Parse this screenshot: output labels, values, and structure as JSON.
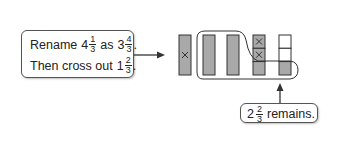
{
  "instruction_callout": {
    "line1": {
      "prefix": "Rename",
      "whole_a": "4",
      "frac_a_num": "1",
      "frac_a_den": "3",
      "mid": "as",
      "whole_b": "3",
      "frac_b_num": "4",
      "frac_b_den": "3",
      "suffix": "."
    },
    "line2": {
      "prefix": "Then cross out",
      "whole": "1",
      "frac_num": "2",
      "frac_den": "3",
      "suffix": "."
    }
  },
  "result_callout": {
    "whole": "2",
    "frac_num": "2",
    "frac_den": "3",
    "suffix": "remains."
  },
  "bars": [
    {
      "id": 1,
      "type": "whole",
      "crossed": true
    },
    {
      "id": 2,
      "type": "whole",
      "crossed": false
    },
    {
      "id": 3,
      "type": "whole",
      "crossed": false
    },
    {
      "id": 4,
      "type": "thirds",
      "parts": [
        {
          "shaded": true,
          "crossed": true
        },
        {
          "shaded": true,
          "crossed": true
        },
        {
          "shaded": true,
          "crossed": false
        }
      ]
    },
    {
      "id": 5,
      "type": "thirds",
      "parts": [
        {
          "shaded": false,
          "crossed": false
        },
        {
          "shaded": false,
          "crossed": false
        },
        {
          "shaded": true,
          "crossed": false
        }
      ]
    }
  ],
  "colors": {
    "bar_fill": "#a9a9a9",
    "stroke": "#333333",
    "empty_fill": "#ffffff"
  }
}
